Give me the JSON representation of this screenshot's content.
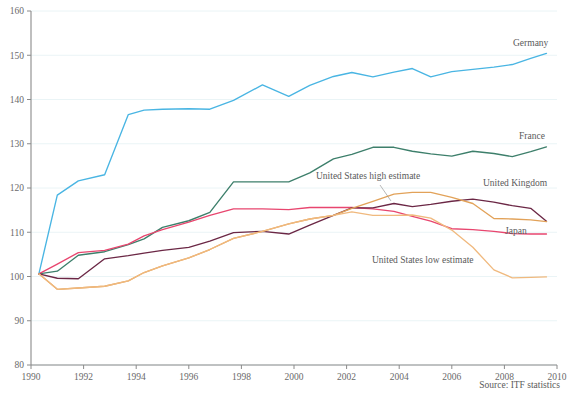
{
  "chart_data": {
    "type": "line",
    "title": "",
    "xlabel": "",
    "ylabel": "",
    "xlim": [
      1990,
      2010
    ],
    "ylim": [
      80,
      160
    ],
    "grid": true,
    "legend_position": "inline-end-of-line",
    "x_ticks": [
      "1990",
      "1992",
      "1994",
      "1996",
      "1998",
      "2000",
      "2002",
      "2004",
      "2006",
      "2008",
      "2010"
    ],
    "y_ticks": [
      "80",
      "90",
      "100",
      "110",
      "120",
      "130",
      "140",
      "150",
      "160"
    ],
    "source_note": "Source: ITF statistics",
    "x": [
      1990.3,
      1991,
      1991.8,
      1992.8,
      1993.7,
      1994.3,
      1995,
      1996,
      1996.8,
      1997.7,
      1998.8,
      1999.8,
      2000.6,
      2001.5,
      2002.2,
      2003,
      2003.8,
      2004.5,
      2005.2,
      2006,
      2006.8,
      2007.6,
      2008.3,
      2009,
      2009.6
    ],
    "series": [
      {
        "name": "Germany",
        "color": "#49b5e3",
        "label": "Germany",
        "label_x": 513,
        "label_y": 46,
        "values": [
          100.6,
          118.4,
          121.6,
          123.0,
          136.6,
          137.6,
          137.8,
          137.9,
          137.8,
          139.8,
          143.3,
          140.7,
          143.2,
          145.2,
          146.1,
          145.1,
          146.2,
          147.0,
          145.1,
          146.3,
          146.8,
          147.3,
          147.9,
          149.3,
          150.4
        ]
      },
      {
        "name": "France",
        "color": "#3d7f6b",
        "label": "France",
        "label_x": 519,
        "label_y": 139,
        "values": [
          100.6,
          101.2,
          104.8,
          105.6,
          107.2,
          108.5,
          111.1,
          112.6,
          114.5,
          121.4,
          121.4,
          121.4,
          123.4,
          126.6,
          127.6,
          129.2,
          129.2,
          128.3,
          127.7,
          127.2,
          128.3,
          127.8,
          127.1,
          128.2,
          129.3
        ]
      },
      {
        "name": "Japan",
        "color": "#e8466f",
        "label": "Japan",
        "label_x": 505,
        "label_y": 234,
        "values": [
          100.6,
          102.8,
          105.4,
          105.9,
          107.3,
          109.2,
          110.6,
          112.3,
          113.8,
          115.3,
          115.3,
          115.1,
          115.6,
          115.6,
          115.6,
          115.3,
          114.7,
          113.6,
          112.5,
          110.8,
          110.6,
          110.2,
          109.7,
          109.6,
          109.6
        ]
      },
      {
        "name": "United Kingdom",
        "color": "#6b2745",
        "label": "United Kingdom",
        "label_x": 483,
        "label_y": 186,
        "values": [
          100.6,
          99.6,
          99.5,
          104.0,
          104.7,
          105.3,
          105.9,
          106.6,
          108.0,
          109.9,
          110.2,
          109.6,
          111.6,
          113.8,
          115.5,
          115.5,
          116.5,
          115.8,
          116.3,
          117.0,
          117.5,
          116.8,
          116.0,
          115.4,
          112.5
        ]
      },
      {
        "name": "United States high estimate",
        "color": "#e2a259",
        "label": "United States high estimate",
        "label_x": 316,
        "label_y": 179,
        "leader": [
          [
            380,
            185
          ],
          [
            391,
            201
          ]
        ],
        "values": [
          100.6,
          97.1,
          97.4,
          97.8,
          99.0,
          100.9,
          102.4,
          104.2,
          106.1,
          108.6,
          110.2,
          111.9,
          113.0,
          113.8,
          115.4,
          117.0,
          118.6,
          119.0,
          119.0,
          117.9,
          116.5,
          113.1,
          113.0,
          112.8,
          112.4
        ]
      },
      {
        "name": "United States low estimate",
        "color": "#f0b97e",
        "label": "United States low estimate",
        "label_x": 372,
        "label_y": 263,
        "values": [
          100.6,
          97.1,
          97.4,
          97.8,
          99.0,
          100.9,
          102.4,
          104.2,
          106.1,
          108.6,
          110.2,
          111.9,
          113.0,
          113.8,
          114.6,
          113.8,
          113.8,
          113.9,
          113.2,
          110.5,
          106.6,
          101.5,
          99.7,
          99.8,
          99.9
        ]
      }
    ]
  }
}
